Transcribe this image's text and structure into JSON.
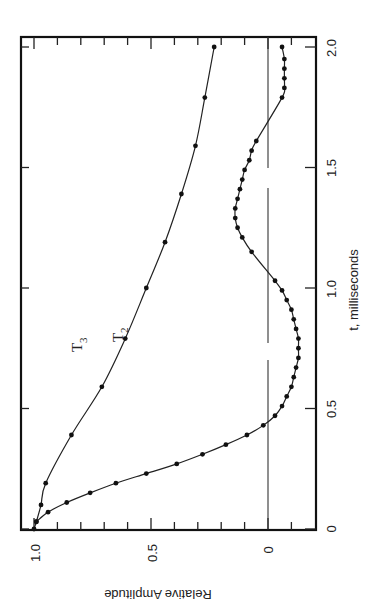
{
  "chart_data": {
    "type": "line",
    "orientation": "rotated 90 degrees counter-clockwise",
    "title": "",
    "xlabel": "t,  milliseconds",
    "ylabel": "Relative  Amplitude",
    "xlim": [
      0,
      2.0
    ],
    "ylim": [
      -0.15,
      1.05
    ],
    "x_ticks": [
      "0",
      "0.5",
      "1.0",
      "1.5",
      "2.0"
    ],
    "y_ticks": [
      "0",
      "0.5",
      "1.0"
    ],
    "grid": false,
    "zero_line": true,
    "legend": null,
    "series": [
      {
        "name": "T3",
        "label": "T",
        "subscript": "3",
        "marker": "circle",
        "points": [
          [
            0.0,
            1.0
          ],
          [
            0.03,
            0.99
          ],
          [
            0.1,
            0.97
          ],
          [
            0.19,
            0.95
          ],
          [
            0.39,
            0.84
          ],
          [
            0.59,
            0.71
          ],
          [
            0.79,
            0.61
          ],
          [
            1.0,
            0.52
          ],
          [
            1.19,
            0.44
          ],
          [
            1.39,
            0.37
          ],
          [
            1.59,
            0.31
          ],
          [
            1.79,
            0.27
          ],
          [
            2.0,
            0.23
          ]
        ]
      },
      {
        "name": "T2",
        "label": "T",
        "subscript": "2",
        "marker": "circle",
        "points": [
          [
            0.03,
            0.99
          ],
          [
            0.07,
            0.94
          ],
          [
            0.11,
            0.86
          ],
          [
            0.15,
            0.76
          ],
          [
            0.19,
            0.65
          ],
          [
            0.23,
            0.52
          ],
          [
            0.27,
            0.39
          ],
          [
            0.31,
            0.28
          ],
          [
            0.35,
            0.18
          ],
          [
            0.39,
            0.09
          ],
          [
            0.43,
            0.02
          ],
          [
            0.47,
            -0.03
          ],
          [
            0.51,
            -0.06
          ],
          [
            0.55,
            -0.08
          ],
          [
            0.59,
            -0.1
          ],
          [
            0.63,
            -0.11
          ],
          [
            0.67,
            -0.12
          ],
          [
            0.71,
            -0.13
          ],
          [
            0.75,
            -0.13
          ],
          [
            0.79,
            -0.13
          ],
          [
            0.83,
            -0.12
          ],
          [
            0.87,
            -0.11
          ],
          [
            0.91,
            -0.1
          ],
          [
            0.95,
            -0.08
          ],
          [
            0.99,
            -0.06
          ],
          [
            1.03,
            -0.03
          ],
          [
            1.15,
            0.07
          ],
          [
            1.21,
            0.11
          ],
          [
            1.25,
            0.13
          ],
          [
            1.29,
            0.14
          ],
          [
            1.33,
            0.14
          ],
          [
            1.37,
            0.13
          ],
          [
            1.41,
            0.12
          ],
          [
            1.45,
            0.11
          ],
          [
            1.49,
            0.1
          ],
          [
            1.53,
            0.08
          ],
          [
            1.57,
            0.07
          ],
          [
            1.61,
            0.05
          ],
          [
            1.79,
            -0.06
          ],
          [
            1.83,
            -0.07
          ],
          [
            1.87,
            -0.07
          ],
          [
            1.91,
            -0.07
          ],
          [
            1.95,
            -0.07
          ],
          [
            2.0,
            -0.06
          ]
        ]
      }
    ]
  },
  "labels": {
    "x_title": "t,  milliseconds",
    "y_title": "Relative  Amplitude",
    "x_ticks": [
      "0",
      "0.5",
      "1.0",
      "1.5",
      "2.0"
    ],
    "y_ticks": [
      "1.0",
      "0.5",
      "0"
    ],
    "t3": "T",
    "t3_sub": "3",
    "t2": "T",
    "t2_sub": "2"
  }
}
